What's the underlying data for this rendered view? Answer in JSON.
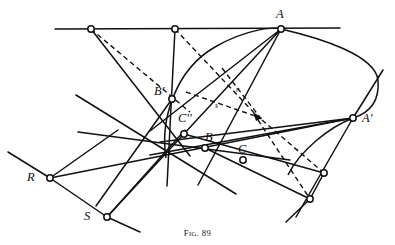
{
  "figure": {
    "caption_prefix": "F",
    "caption_small": "IG",
    "caption_suffix": ". 89",
    "caption_full": "Fig. 89",
    "ink_color": "#111111",
    "paper_color": "#ffffff"
  },
  "labels": {
    "A": {
      "text": "A",
      "x": 276,
      "y": 8,
      "size": "big"
    },
    "Ap": {
      "text": "A'",
      "x": 362,
      "y": 112,
      "size": "big"
    },
    "Bp": {
      "text": "B'",
      "x": 154,
      "y": 85,
      "size": "big"
    },
    "Cpp": {
      "text": "C''",
      "x": 178,
      "y": 112,
      "size": "big"
    },
    "B": {
      "text": "B",
      "x": 205,
      "y": 131,
      "size": "big"
    },
    "C": {
      "text": "C",
      "x": 238,
      "y": 143,
      "size": "big"
    },
    "R": {
      "text": "R",
      "x": 27,
      "y": 171,
      "size": "big"
    },
    "S": {
      "text": "S",
      "x": 84,
      "y": 210,
      "size": "big"
    },
    "r": {
      "text": "r",
      "x": 236,
      "y": 86,
      "size": "small"
    },
    "s": {
      "text": "s",
      "x": 215,
      "y": 102,
      "size": "small"
    }
  },
  "points": [
    {
      "name": "A",
      "x": 281,
      "y": 29,
      "marker": "open"
    },
    {
      "name": "A-prime",
      "x": 353,
      "y": 118,
      "marker": "open"
    },
    {
      "name": "B-prime",
      "x": 172,
      "y": 99,
      "marker": "open"
    },
    {
      "name": "C-double-prime",
      "x": 184,
      "y": 134,
      "marker": "open"
    },
    {
      "name": "B",
      "x": 205,
      "y": 148,
      "marker": "open"
    },
    {
      "name": "C",
      "x": 243,
      "y": 160,
      "marker": "open"
    },
    {
      "name": "R",
      "x": 50,
      "y": 178,
      "marker": "open"
    },
    {
      "name": "S",
      "x": 107,
      "y": 217,
      "marker": "open"
    },
    {
      "name": "top-left-node",
      "x": 91,
      "y": 29,
      "marker": "open"
    },
    {
      "name": "top-mid-node",
      "x": 175,
      "y": 29,
      "marker": "open"
    },
    {
      "name": "right-upper-node",
      "x": 324,
      "y": 173,
      "marker": "open"
    },
    {
      "name": "right-lower-node",
      "x": 310,
      "y": 199,
      "marker": "open"
    },
    {
      "name": "pole-point",
      "x": 258,
      "y": 117,
      "marker": "filled"
    }
  ],
  "chart_data": {
    "type": "diagram",
    "title": "Fig. 89",
    "solid_lines": [
      {
        "name": "top-horizontal-line",
        "x1": 55,
        "y1": 29,
        "x2": 340,
        "y2": 28
      },
      {
        "name": "line-topleft-to-Cpp",
        "x1": 91,
        "y1": 29,
        "x2": 190,
        "y2": 156
      },
      {
        "name": "line-topmid-vertical",
        "x1": 175,
        "y1": 29,
        "x2": 167,
        "y2": 186
      },
      {
        "name": "line-A-to-Bprime",
        "x1": 281,
        "y1": 29,
        "x2": 150,
        "y2": 131
      },
      {
        "name": "line-A-to-S",
        "x1": 281,
        "y1": 29,
        "x2": 107,
        "y2": 217
      },
      {
        "name": "line-A-to-C",
        "x1": 281,
        "y1": 29,
        "x2": 198,
        "y2": 185
      },
      {
        "name": "line-Aprime-to-R",
        "x1": 353,
        "y1": 118,
        "x2": 50,
        "y2": 178
      },
      {
        "name": "line-Aprime-to-Cpp",
        "x1": 353,
        "y1": 118,
        "x2": 160,
        "y2": 142
      },
      {
        "name": "line-Aprime-to-B",
        "x1": 353,
        "y1": 118,
        "x2": 150,
        "y2": 155
      },
      {
        "name": "line-Aprime-upper-ray",
        "x1": 353,
        "y1": 118,
        "x2": 383,
        "y2": 70
      },
      {
        "name": "line-Aprime-lower-ray",
        "x1": 353,
        "y1": 118,
        "x2": 296,
        "y2": 217
      },
      {
        "name": "line-R-to-S",
        "x1": 50,
        "y1": 178,
        "x2": 107,
        "y2": 217
      },
      {
        "name": "line-R-upleft-ray",
        "x1": 50,
        "y1": 178,
        "x2": 8,
        "y2": 152
      },
      {
        "name": "line-R-to-Bprime-up",
        "x1": 50,
        "y1": 178,
        "x2": 118,
        "y2": 130
      },
      {
        "name": "line-S-to-topright",
        "x1": 107,
        "y1": 217,
        "x2": 185,
        "y2": 130
      },
      {
        "name": "line-S-downright-ray",
        "x1": 107,
        "y1": 217,
        "x2": 140,
        "y2": 232
      },
      {
        "name": "line-left-diag-1",
        "x1": 76,
        "y1": 95,
        "x2": 236,
        "y2": 194
      },
      {
        "name": "line-left-diag-2",
        "x1": 78,
        "y1": 132,
        "x2": 290,
        "y2": 160
      },
      {
        "name": "line-Cpp-to-rightnode",
        "x1": 184,
        "y1": 134,
        "x2": 324,
        "y2": 173
      },
      {
        "name": "line-B-to-rightlower",
        "x1": 205,
        "y1": 148,
        "x2": 310,
        "y2": 199
      },
      {
        "name": "line-rightnodes",
        "x1": 324,
        "y1": 173,
        "x2": 310,
        "y2": 199
      },
      {
        "name": "line-right-through-ray",
        "x1": 310,
        "y1": 199,
        "x2": 286,
        "y2": 222
      },
      {
        "name": "line-Bprime-down-left",
        "x1": 172,
        "y1": 99,
        "x2": 96,
        "y2": 206
      }
    ],
    "dashed_lines": [
      {
        "name": "dash-topleft-to-pole",
        "x1": 91,
        "y1": 29,
        "x2": 190,
        "y2": 112
      },
      {
        "name": "dash-topmid-to-pole",
        "x1": 175,
        "y1": 29,
        "x2": 258,
        "y2": 117
      },
      {
        "name": "dash-r-axis",
        "x1": 222,
        "y1": 68,
        "x2": 262,
        "y2": 120
      },
      {
        "name": "dash-s-axis",
        "x1": 186,
        "y1": 92,
        "x2": 258,
        "y2": 117
      },
      {
        "name": "dash-pole-to-rightnode",
        "x1": 262,
        "y1": 120,
        "x2": 324,
        "y2": 173
      },
      {
        "name": "dash-pole-to-rightlow",
        "x1": 258,
        "y1": 120,
        "x2": 310,
        "y2": 199
      }
    ],
    "conic": {
      "name": "conic-through-A-Aprime-Bprime",
      "path": "M 166,158 C 160,120 175,70 215,47 C 248,28 275,27 281,29 C 320,38 375,55 378,80 C 380,104 366,114 353,118 C 330,127 300,150 288,175"
    }
  }
}
